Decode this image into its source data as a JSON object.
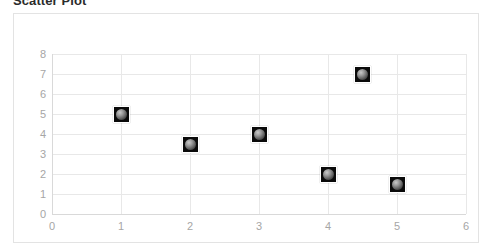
{
  "chart_title": "Scatter Plot",
  "axis": {
    "x_ticks": [
      "0",
      "1",
      "2",
      "3",
      "4",
      "5",
      "6"
    ],
    "y_ticks": [
      "0",
      "1",
      "2",
      "3",
      "4",
      "5",
      "6",
      "7",
      "8"
    ]
  },
  "colors": {
    "marker_fill": "#0a0a0a",
    "marker_bead": "#9a9a9a",
    "gridline": "#e8e8e8",
    "frame_border": "#e3e3e3",
    "tick_label": "#a6a6a6",
    "title_text": "#2b2b2b",
    "plot_background": "#ffffff"
  },
  "chart_data": {
    "type": "scatter",
    "title": "Scatter Plot",
    "xlabel": "",
    "ylabel": "",
    "xlim": [
      0,
      6
    ],
    "ylim": [
      0,
      8
    ],
    "xticks": [
      0,
      1,
      2,
      3,
      4,
      5,
      6
    ],
    "yticks": [
      0,
      1,
      2,
      3,
      4,
      5,
      6,
      7,
      8
    ],
    "grid": true,
    "legend": false,
    "legend_position": "none",
    "series": [
      {
        "name": "Series 1",
        "marker": "square-bead",
        "points": [
          {
            "x": 1,
            "y": 5
          },
          {
            "x": 2,
            "y": 3.5
          },
          {
            "x": 3,
            "y": 4
          },
          {
            "x": 4,
            "y": 2
          },
          {
            "x": 4.5,
            "y": 7
          },
          {
            "x": 5,
            "y": 1.5
          }
        ]
      }
    ]
  }
}
